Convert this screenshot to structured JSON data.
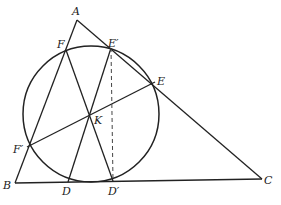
{
  "diagram": {
    "type": "geometry",
    "points": {
      "A": {
        "label": "A",
        "x": 77,
        "y": 20
      },
      "B": {
        "label": "B",
        "x": 15,
        "y": 183
      },
      "C": {
        "label": "C",
        "x": 262,
        "y": 179
      },
      "F": {
        "label": "F",
        "x": 66,
        "y": 50
      },
      "E_prime": {
        "label": "E′",
        "x": 111,
        "y": 48
      },
      "E": {
        "label": "E",
        "x": 155,
        "y": 82
      },
      "K": {
        "label": "K",
        "x": 89,
        "y": 114
      },
      "F_prime": {
        "label": "F′",
        "x": 27,
        "y": 147
      },
      "D": {
        "label": "D",
        "x": 68,
        "y": 182
      },
      "D_prime": {
        "label": "D′",
        "x": 113,
        "y": 181
      }
    },
    "circle": {
      "cx": 91,
      "cy": 114,
      "r": 68
    },
    "segments": [
      {
        "from": "A",
        "to": "B",
        "style": "solid"
      },
      {
        "from": "A",
        "to": "C",
        "style": "solid"
      },
      {
        "from": "B",
        "to": "C",
        "style": "solid"
      },
      {
        "from": "F",
        "to": "D_prime",
        "style": "solid"
      },
      {
        "from": "E_prime",
        "to": "D",
        "style": "solid"
      },
      {
        "from": "F_prime",
        "to": "E",
        "style": "solid"
      },
      {
        "from": "F",
        "to": "F_prime",
        "style": "solid"
      },
      {
        "from": "E_prime",
        "to": "D_prime",
        "style": "dashed"
      }
    ]
  },
  "labels": {
    "A": "A",
    "B": "B",
    "C": "C",
    "D": "D",
    "D_prime": "D′",
    "E": "E",
    "E_prime": "E′",
    "F": "F",
    "F_prime": "F′",
    "K": "K"
  }
}
